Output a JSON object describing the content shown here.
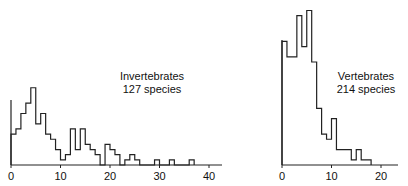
{
  "chart_data": [
    {
      "type": "bar",
      "title": "",
      "annotation": [
        "Invertebrates",
        "127 species"
      ],
      "bin_start": 0,
      "bin_width": 1,
      "values": [
        6,
        7,
        10,
        12,
        15,
        8,
        10,
        6,
        5,
        3,
        1,
        2,
        7,
        3,
        7,
        4,
        3,
        2,
        0,
        4,
        3,
        2,
        0,
        1,
        2,
        1,
        0,
        0,
        0,
        1,
        0,
        0,
        1,
        0,
        0,
        0,
        1
      ],
      "xticks": [
        "0",
        "10",
        "20",
        "30",
        "40"
      ],
      "xlim": [
        0,
        45
      ],
      "ylim": [
        0,
        16
      ]
    },
    {
      "type": "bar",
      "title": "",
      "annotation": [
        "Vertebrates",
        "214 species"
      ],
      "bin_start": 0,
      "bin_width": 1,
      "values": [
        24,
        21,
        21,
        29,
        23,
        30,
        20,
        11,
        6,
        5,
        9,
        3,
        3,
        3,
        1,
        3,
        1,
        1
      ],
      "xticks": [
        "0",
        "10",
        "20"
      ],
      "xlim": [
        0,
        24
      ],
      "ylim": [
        0,
        31
      ]
    }
  ]
}
